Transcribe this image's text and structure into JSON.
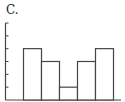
{
  "panel_label": "C.",
  "chart_data": {
    "type": "bar",
    "title": "",
    "panel_label": "C.",
    "categories": [
      "1",
      "2",
      "3",
      "4",
      "5"
    ],
    "values": [
      4,
      3,
      1,
      3,
      4
    ],
    "xlabel": "",
    "ylabel": "",
    "ylim": [
      0,
      6
    ],
    "yticks": [
      1,
      2,
      3,
      4,
      5,
      6
    ],
    "tick_labels_shown": false,
    "grid": false,
    "bar_style": "histogram, unfilled outlined bars, adjacent",
    "colors": {
      "stroke": "#444444",
      "fill": "#ffffff"
    }
  }
}
